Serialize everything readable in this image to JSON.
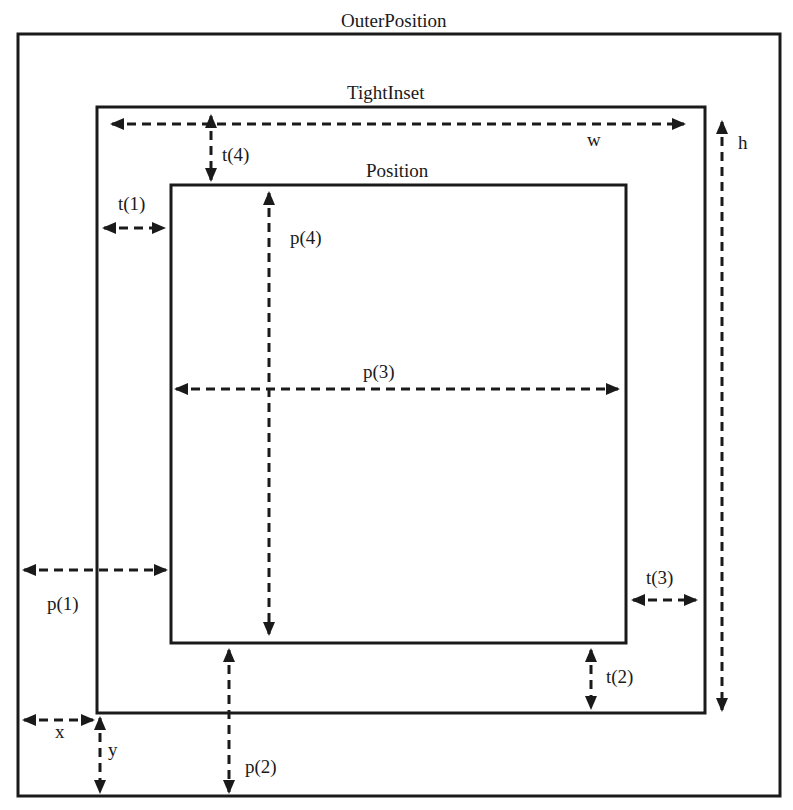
{
  "diagram": {
    "type": "nested-rectangles-annotation",
    "colors": {
      "stroke": "#1a1a1a",
      "background": "#ffffff"
    },
    "boxes": {
      "outer_position": {
        "label": "OuterPosition",
        "left": 18,
        "top": 34,
        "right": 780,
        "bottom": 796
      },
      "tight_inset": {
        "label": "TightInset",
        "left": 97,
        "top": 107,
        "right": 705,
        "bottom": 713
      },
      "position": {
        "label": "Position",
        "left": 171,
        "top": 185,
        "right": 626,
        "bottom": 643
      }
    },
    "dimensions": {
      "w": "w",
      "h": "h",
      "t1": "t(1)",
      "t2": "t(2)",
      "t3": "t(3)",
      "t4": "t(4)",
      "p1": "p(1)",
      "p2": "p(2)",
      "p3": "p(3)",
      "p4": "p(4)",
      "x": "x",
      "y": "y"
    }
  }
}
